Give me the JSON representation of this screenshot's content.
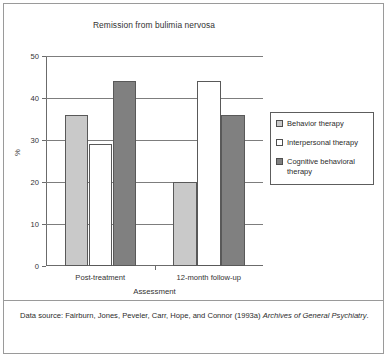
{
  "chart_data": {
    "type": "bar",
    "title": "Remission from bulimia nervosa",
    "xlabel": "Assessment",
    "ylabel": "%",
    "categories": [
      "Post-treatment",
      "12-month follow-up"
    ],
    "series": [
      {
        "name": "Behavior therapy",
        "values": [
          36,
          20
        ],
        "color": "#c9c9c9"
      },
      {
        "name": "Interpersonal therapy",
        "values": [
          29,
          44
        ],
        "color": "#ffffff"
      },
      {
        "name": "Cognitive behavioral therapy",
        "values": [
          44,
          36
        ],
        "color": "#808080"
      }
    ],
    "ylim": [
      0,
      50
    ],
    "yticks": [
      0,
      10,
      20,
      30,
      40,
      50
    ],
    "grid": true,
    "legend_position": "right"
  },
  "legend": {
    "items": [
      {
        "label": "Behavior therapy"
      },
      {
        "label": "Interpersonal therapy"
      },
      {
        "label": "Cognitive behavioral therapy"
      }
    ]
  },
  "footer": {
    "prefix": "Data source: Fairburn, Jones, Peveler, Carr, Hope, and Connor (1993a) ",
    "journal": "Archives of General Psychiatry",
    "suffix": "."
  }
}
